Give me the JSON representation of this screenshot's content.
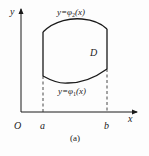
{
  "figure": {
    "caption": "(a)",
    "axes": {
      "x_label": "x",
      "y_label": "y",
      "origin_label": "O"
    },
    "ticks": {
      "a": "a",
      "b": "b"
    },
    "region_label": "D",
    "curves": {
      "upper": {
        "lhs": "y=",
        "func": "φ",
        "sub": "2",
        "arg": "(x)"
      },
      "lower": {
        "lhs": "y=",
        "func": "φ",
        "sub": "1",
        "arg": "(x)"
      }
    },
    "colors": {
      "stroke": "#1a1a1a",
      "text": "#222222",
      "background": "#fdfdfd"
    }
  }
}
